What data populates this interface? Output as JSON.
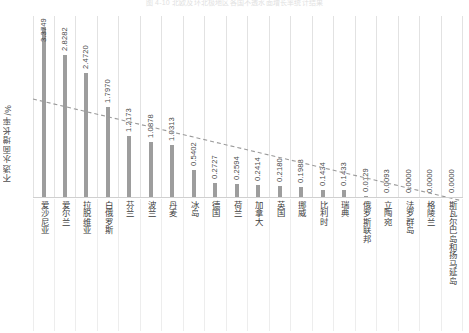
{
  "chart_data": {
    "type": "bar",
    "title": "图 4-10  北欧及环北极地区各国不透水面增长率统计结果",
    "xlabel": "",
    "ylabel": "不透水面增长率/%",
    "ylim": [
      0,
      3.6
    ],
    "grid": true,
    "legend": false,
    "bar_color": "#9d9d9d",
    "trendline": {
      "style": "dashed",
      "color": "#9a9a9a",
      "y_start": 1.95,
      "y_end": -0.08
    },
    "categories": [
      "爱沙尼亚",
      "爱尔兰",
      "拉脱维亚",
      "白俄罗斯",
      "芬兰",
      "波兰",
      "丹麦",
      "冰岛",
      "德国",
      "荷兰",
      "加拿大",
      "英国",
      "挪威",
      "比利时",
      "瑞典",
      "俄罗斯联邦",
      "立陶宛",
      "法罗群岛",
      "格陵兰",
      "斯瓦尔巴岛和扬马延岛"
    ],
    "values": [
      3.3749,
      2.8282,
      2.472,
      1.797,
      1.2173,
      1.0878,
      1.0313,
      0.5402,
      0.2727,
      0.2594,
      0.2414,
      0.218,
      0.1988,
      0.1434,
      0.1433,
      0.0129,
      0.0093,
      0.0,
      0.0,
      0.0
    ],
    "value_labels": [
      "3.3749",
      "2.8282",
      "2.4720",
      "1.7970",
      "1.2173",
      "1.0878",
      "1.0313",
      "0.5402",
      "0.2727",
      "0.2594",
      "0.2414",
      "0.2180",
      "0.1988",
      "0.1434",
      "0.1433",
      "0.0129",
      "0.0093",
      "0.0000",
      "0.0000",
      "0.0000"
    ]
  }
}
